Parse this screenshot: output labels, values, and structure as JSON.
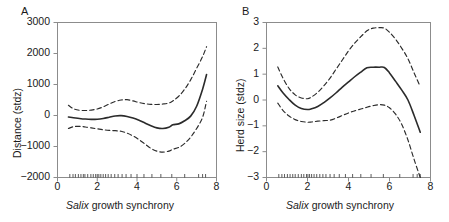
{
  "figure": {
    "background": "#ffffff",
    "line_color": "#2b2b2b",
    "axis_color": "#8c8c8c",
    "width": 449,
    "height": 222
  },
  "panels": [
    {
      "letter": "A",
      "xlabel_italic": "Salix",
      "xlabel_rest": " growth synchrony",
      "ylabel": "Distance (stdz)"
    },
    {
      "letter": "B",
      "xlabel_italic": "Salix",
      "xlabel_rest": " growth synchrony",
      "ylabel": "Herd size (stdz)"
    }
  ],
  "chart_data": [
    {
      "type": "line",
      "panel": "A",
      "title": "",
      "xlabel": "Salix growth synchrony",
      "ylabel": "Distance (stdz)",
      "xlim": [
        0,
        8
      ],
      "ylim": [
        -2000,
        3000
      ],
      "xticks": [
        0,
        2,
        4,
        6,
        8
      ],
      "yticks": [
        -2000,
        -1000,
        0,
        1000,
        2000,
        3000
      ],
      "grid": false,
      "legend": "none",
      "series": [
        {
          "name": "fit",
          "style": "solid",
          "x": [
            0.55,
            0.8,
            1.1,
            1.4,
            1.7,
            2.0,
            2.3,
            2.6,
            2.9,
            3.2,
            3.5,
            3.8,
            4.1,
            4.4,
            4.7,
            5.0,
            5.3,
            5.6,
            5.8,
            6.1,
            6.4,
            6.7,
            7.0,
            7.3,
            7.5
          ],
          "y": [
            -50,
            -70,
            -95,
            -115,
            -125,
            -120,
            -95,
            -55,
            -15,
            -5,
            -30,
            -80,
            -150,
            -240,
            -330,
            -400,
            -420,
            -380,
            -300,
            -270,
            -170,
            -20,
            300,
            850,
            1320
          ]
        },
        {
          "name": "upper-confidence",
          "style": "dashed",
          "x": [
            0.55,
            0.8,
            1.1,
            1.4,
            1.7,
            2.0,
            2.3,
            2.6,
            2.9,
            3.2,
            3.5,
            3.8,
            4.1,
            4.4,
            4.7,
            5.0,
            5.3,
            5.6,
            5.8,
            6.1,
            6.4,
            6.7,
            7.0,
            7.3,
            7.5
          ],
          "y": [
            330,
            220,
            170,
            160,
            175,
            210,
            280,
            370,
            450,
            500,
            510,
            470,
            420,
            380,
            360,
            355,
            370,
            400,
            470,
            620,
            850,
            1150,
            1520,
            1900,
            2220
          ]
        },
        {
          "name": "lower-confidence",
          "style": "dashed",
          "x": [
            0.55,
            0.8,
            1.1,
            1.4,
            1.7,
            2.0,
            2.3,
            2.6,
            2.9,
            3.2,
            3.5,
            3.8,
            4.1,
            4.4,
            4.7,
            5.0,
            5.3,
            5.6,
            5.8,
            6.1,
            6.4,
            6.7,
            7.0,
            7.3,
            7.5
          ],
          "y": [
            -420,
            -360,
            -350,
            -370,
            -400,
            -430,
            -460,
            -480,
            -490,
            -510,
            -570,
            -660,
            -780,
            -920,
            -1060,
            -1150,
            -1180,
            -1150,
            -1090,
            -1030,
            -900,
            -700,
            -420,
            -60,
            460
          ]
        }
      ],
      "rug_x": [
        0.62,
        0.78,
        0.9,
        1.05,
        1.18,
        1.3,
        1.38,
        1.52,
        1.68,
        1.8,
        1.92,
        2.0,
        2.08,
        2.18,
        2.3,
        2.42,
        2.55,
        2.7,
        2.88,
        3.05,
        3.25,
        3.45,
        3.7,
        4.0,
        4.35,
        4.75,
        5.2,
        5.75,
        6.4,
        7.1,
        7.3,
        7.45
      ]
    },
    {
      "type": "line",
      "panel": "B",
      "title": "",
      "xlabel": "Salix growth synchrony",
      "ylabel": "Herd size (stdz)",
      "xlim": [
        0,
        8
      ],
      "ylim": [
        -3,
        3
      ],
      "xticks": [
        0,
        2,
        4,
        6,
        8
      ],
      "yticks": [
        -3,
        -2,
        -1,
        0,
        1,
        2,
        3
      ],
      "grid": false,
      "legend": "none",
      "series": [
        {
          "name": "fit",
          "style": "solid",
          "x": [
            0.55,
            0.8,
            1.1,
            1.4,
            1.7,
            2.0,
            2.2,
            2.5,
            2.8,
            3.1,
            3.4,
            3.7,
            4.0,
            4.3,
            4.6,
            4.9,
            5.2,
            5.5,
            5.75,
            6.0,
            6.3,
            6.6,
            6.9,
            7.2,
            7.5
          ],
          "y": [
            0.55,
            0.28,
            0.02,
            -0.2,
            -0.33,
            -0.37,
            -0.34,
            -0.25,
            -0.1,
            0.08,
            0.28,
            0.5,
            0.7,
            0.9,
            1.08,
            1.25,
            1.27,
            1.27,
            1.26,
            1.05,
            0.72,
            0.38,
            0.0,
            -0.6,
            -1.25
          ]
        },
        {
          "name": "upper-confidence",
          "style": "dashed",
          "x": [
            0.55,
            0.8,
            1.1,
            1.4,
            1.7,
            2.0,
            2.2,
            2.5,
            2.8,
            3.1,
            3.4,
            3.7,
            4.0,
            4.3,
            4.6,
            4.9,
            5.2,
            5.5,
            5.75,
            6.0,
            6.3,
            6.6,
            6.9,
            7.2,
            7.5
          ],
          "y": [
            1.28,
            0.85,
            0.45,
            0.2,
            0.08,
            0.05,
            0.12,
            0.3,
            0.55,
            0.85,
            1.2,
            1.55,
            1.9,
            2.2,
            2.45,
            2.68,
            2.78,
            2.8,
            2.78,
            2.62,
            2.35,
            2.0,
            1.6,
            1.05,
            0.52
          ]
        },
        {
          "name": "lower-confidence",
          "style": "dashed",
          "x": [
            0.55,
            0.8,
            1.1,
            1.4,
            1.7,
            2.0,
            2.2,
            2.5,
            2.8,
            3.1,
            3.4,
            3.7,
            4.0,
            4.3,
            4.6,
            4.9,
            5.2,
            5.5,
            5.75,
            6.0,
            6.3,
            6.6,
            6.9,
            7.2,
            7.5
          ],
          "y": [
            -0.12,
            -0.4,
            -0.62,
            -0.76,
            -0.83,
            -0.86,
            -0.85,
            -0.82,
            -0.8,
            -0.78,
            -0.7,
            -0.6,
            -0.5,
            -0.42,
            -0.35,
            -0.28,
            -0.22,
            -0.18,
            -0.2,
            -0.3,
            -0.55,
            -0.95,
            -1.55,
            -2.3,
            -3.0
          ]
        }
      ],
      "rug_x": [
        0.6,
        0.75,
        0.88,
        1.02,
        1.15,
        1.28,
        1.4,
        1.55,
        1.7,
        1.82,
        1.95,
        2.02,
        2.1,
        2.2,
        2.32,
        2.45,
        2.6,
        2.75,
        2.9,
        3.1,
        3.3,
        3.55,
        3.85,
        4.2,
        4.6,
        5.1,
        5.7,
        6.5,
        7.15,
        7.35,
        7.5
      ]
    }
  ]
}
